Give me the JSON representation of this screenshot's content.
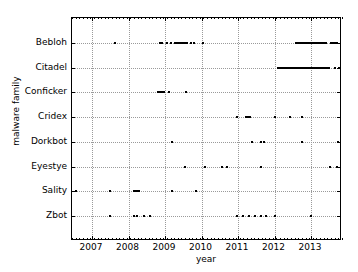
{
  "chart_data": {
    "type": "scatter",
    "title": "",
    "xlabel": "year",
    "ylabel": "malware family",
    "xlim": [
      2006.45,
      2013.85
    ],
    "xticks": [
      2007,
      2008,
      2009,
      2010,
      2011,
      2012,
      2013
    ],
    "xticklabels": [
      "2007",
      "2008",
      "2009",
      "2010",
      "2011",
      "2012",
      "2013"
    ],
    "categories": [
      "Bebloh",
      "Citadel",
      "Conficker",
      "Cridex",
      "Dorkbot",
      "Eyestye",
      "Sality",
      "Zbot"
    ],
    "grid": true,
    "legend": "none",
    "marker": "square",
    "marker_color": "#000000",
    "series": [
      {
        "name": "Bebloh",
        "x": [
          2007.62,
          2008.86,
          2008.93,
          2009.05,
          2009.16,
          2009.27,
          2009.34,
          2009.4,
          2009.45,
          2009.5,
          2009.55,
          2009.6,
          2009.72,
          2009.8,
          2010.03,
          2012.6,
          2012.64,
          2012.68,
          2012.72,
          2012.76,
          2012.8,
          2012.84,
          2012.88,
          2012.92,
          2012.96,
          2013.0,
          2013.04,
          2013.08,
          2013.12,
          2013.16,
          2013.2,
          2013.24,
          2013.28,
          2013.32,
          2013.36,
          2013.4,
          2013.55,
          2013.6,
          2013.66,
          2013.7
        ]
      },
      {
        "name": "Citadel",
        "x": [
          2012.1,
          2012.15,
          2012.2,
          2012.25,
          2012.3,
          2012.35,
          2012.4,
          2012.45,
          2012.5,
          2012.55,
          2012.6,
          2012.65,
          2012.7,
          2012.75,
          2012.8,
          2012.85,
          2012.9,
          2012.95,
          2013.0,
          2013.05,
          2013.1,
          2013.15,
          2013.2,
          2013.25,
          2013.3,
          2013.35,
          2013.4,
          2013.45,
          2013.5,
          2013.66,
          2013.76
        ]
      },
      {
        "name": "Conficker",
        "x": [
          2008.82,
          2008.87,
          2008.92,
          2008.97,
          2009.1,
          2009.58
        ]
      },
      {
        "name": "Cridex",
        "x": [
          2010.98,
          2011.22,
          2011.26,
          2011.3,
          2011.34,
          2012.0,
          2012.42,
          2012.76
        ]
      },
      {
        "name": "Dorkbot",
        "x": [
          2009.18,
          2011.38,
          2011.62,
          2011.7,
          2012.72,
          2012.78,
          2013.72,
          2013.78
        ]
      },
      {
        "name": "Eyestye",
        "x": [
          2009.55,
          2010.08,
          2010.13,
          2010.55,
          2010.68,
          2010.74,
          2011.62,
          2013.52,
          2013.72
        ]
      },
      {
        "name": "Sality",
        "x": [
          2006.52,
          2006.58,
          2007.5,
          2008.14,
          2008.2,
          2008.25,
          2008.3,
          2009.2,
          2009.85
        ]
      },
      {
        "name": "Zbot",
        "x": [
          2007.48,
          2008.14,
          2008.22,
          2008.42,
          2008.58,
          2010.98,
          2011.12,
          2011.18,
          2011.3,
          2011.46,
          2011.62,
          2011.78,
          2012.02,
          2013.0
        ]
      }
    ]
  }
}
